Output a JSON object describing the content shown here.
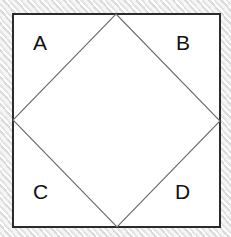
{
  "figure": {
    "background_color": "#e9e9e9",
    "fill_color": "#ffffff",
    "outer_border_color": "#2b2b2b",
    "diamond_line_color": "#6e6e6e",
    "label_color": "#111111",
    "outer_square": {
      "name": "outer-square",
      "x": 13,
      "y": 14,
      "width": 207,
      "height": 213,
      "stroke_width": 1.4
    },
    "inscribed_diamond": {
      "name": "inscribed-diamond",
      "stroke_width": 1.1,
      "vertices": [
        {
          "name": "top-vertex",
          "x": 116,
          "y": 14
        },
        {
          "name": "right-vertex",
          "x": 220,
          "y": 121
        },
        {
          "name": "bottom-vertex",
          "x": 117,
          "y": 227
        },
        {
          "name": "left-vertex",
          "x": 13,
          "y": 120
        }
      ]
    },
    "labels": [
      {
        "id": "label-a",
        "text": "A",
        "region": "top-left-triangle",
        "x": 33,
        "y": 32
      },
      {
        "id": "label-b",
        "text": "B",
        "region": "top-right-triangle",
        "x": 176,
        "y": 32
      },
      {
        "id": "label-c",
        "text": "C",
        "region": "bottom-left-triangle",
        "x": 33,
        "y": 181
      },
      {
        "id": "label-d",
        "text": "D",
        "region": "bottom-right-triangle",
        "x": 175,
        "y": 181
      }
    ]
  }
}
